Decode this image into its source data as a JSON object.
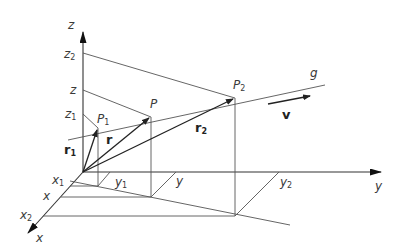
{
  "diagram": {
    "title": "",
    "axes": {
      "z": {
        "label": "z"
      },
      "y": {
        "label": "y"
      },
      "x": {
        "label": "x"
      }
    },
    "z_ticks": {
      "z2": {
        "base": "z",
        "sub": "2"
      },
      "z": {
        "base": "z",
        "sub": ""
      },
      "z1": {
        "base": "z",
        "sub": "1"
      }
    },
    "y_ticks": {
      "y1": {
        "base": "y",
        "sub": "1"
      },
      "y": {
        "base": "y",
        "sub": ""
      },
      "y2": {
        "base": "y",
        "sub": "2"
      }
    },
    "x_ticks": {
      "x1": {
        "base": "x",
        "sub": "1"
      },
      "x": {
        "base": "x",
        "sub": ""
      },
      "x2": {
        "base": "x",
        "sub": "2"
      }
    },
    "points": {
      "P1": {
        "base": "P",
        "sub": "1"
      },
      "P": {
        "base": "P",
        "sub": ""
      },
      "P2": {
        "base": "P",
        "sub": "2"
      }
    },
    "vectors": {
      "r1": {
        "base": "r",
        "sub": "1"
      },
      "r": {
        "base": "r",
        "sub": ""
      },
      "r2": {
        "base": "r",
        "sub": "2"
      },
      "v": {
        "base": "v"
      }
    },
    "line": {
      "label": "g"
    },
    "colors": {
      "ink": "#333333",
      "background": "#ffffff"
    }
  }
}
